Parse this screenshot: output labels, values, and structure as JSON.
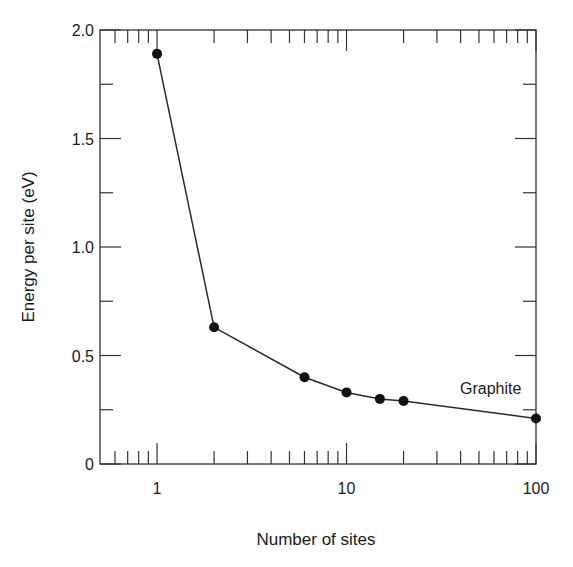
{
  "chart_data": {
    "type": "line",
    "title": "",
    "xlabel": "Number of sites",
    "ylabel": "Energy per site (eV)",
    "xscale": "log",
    "xlim": [
      0.5,
      100
    ],
    "ylim": [
      0,
      2.0
    ],
    "grid": false,
    "x_ticks": [
      1,
      10,
      100
    ],
    "x_tick_labels": [
      "1",
      "10",
      "100"
    ],
    "y_ticks": [
      0,
      0.5,
      1.0,
      1.5,
      2.0
    ],
    "y_tick_labels": [
      "0",
      "0.5",
      "1.0",
      "1.5",
      "2.0"
    ],
    "y_minor_ticks": [
      0.25,
      0.75,
      1.25,
      1.75
    ],
    "series": [
      {
        "name": "Energy per site",
        "marker": "filled-circle",
        "line": "solid",
        "x": [
          1,
          2,
          6,
          10,
          15,
          20,
          100
        ],
        "y": [
          1.89,
          0.63,
          0.4,
          0.33,
          0.3,
          0.29,
          0.21
        ]
      }
    ],
    "annotations": [
      {
        "text": "Graphite",
        "x": 50,
        "y": 0.35
      }
    ],
    "colors": {
      "line": "#2a2a2a",
      "marker": "#111111",
      "axis": "#333333"
    }
  }
}
